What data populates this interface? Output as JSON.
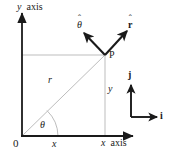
{
  "figure": {
    "type": "vector-diagram",
    "colors": {
      "axis": "#1a1a1a",
      "construction_line": "#b9b9b9",
      "text": "#1a1a1a",
      "background": "#ffffff"
    },
    "axes": {
      "y_label": "y axis",
      "x_label": "x axis",
      "origin_label": "0"
    },
    "labels": {
      "point_p": "P",
      "radius": "r",
      "angle": "θ",
      "x_projection": "x",
      "y_projection": "y",
      "unit_r": "r",
      "unit_r_hat": "ˆ",
      "unit_theta": "θ",
      "unit_theta_hat": "ˆ",
      "unit_i": "i",
      "unit_j": "j"
    },
    "geometry": {
      "origin": [
        22,
        136
      ],
      "point_p": [
        105,
        55
      ],
      "x_axis_end": [
        135,
        136
      ],
      "y_axis_end": [
        22,
        12
      ],
      "r_hat_direction": "up-right",
      "theta_hat_direction": "up-left",
      "i_direction": "right",
      "j_direction": "up"
    }
  }
}
